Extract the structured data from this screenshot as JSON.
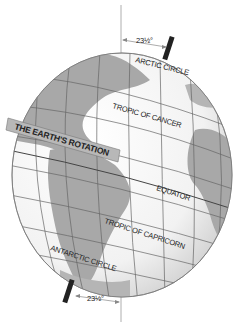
{
  "diagram": {
    "top_angle": "23½°",
    "bottom_angle": "23½°",
    "labels": {
      "arctic_circle": "ARCTIC CIRCLE",
      "tropic_of_cancer": "TROPIC OF CANCER",
      "rotation": "THE EARTH'S ROTATION",
      "equator": "EQUATOR",
      "tropic_of_capricorn": "TROPIC OF CAPRICORN",
      "antarctic_circle": "ANTARCTIC CIRCLE"
    },
    "colors": {
      "ocean": "#ffffff",
      "land": "#a8a8a8",
      "grid": "#666666",
      "axis": "#222222",
      "vertical_reference": "#999999",
      "band": "#b8b8b8"
    }
  }
}
